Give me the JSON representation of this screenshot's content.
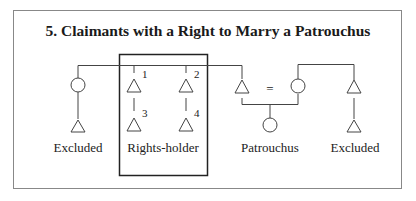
{
  "figure": {
    "title": "5. Claimants with a Right to Marry a Patrouchus",
    "labels": {
      "left_excluded": "Excluded",
      "rights_holder": "Rights-holder",
      "patrouchus": "Patrouchus",
      "right_excluded": "Excluded",
      "marriage_sign": "="
    },
    "numbers": [
      "1",
      "2",
      "3",
      "4"
    ],
    "symbols": {
      "male": "triangle",
      "female": "circle",
      "marriage": "equals"
    },
    "colors": {
      "line": "#444444",
      "text": "#222222",
      "background": "#ffffff"
    }
  }
}
